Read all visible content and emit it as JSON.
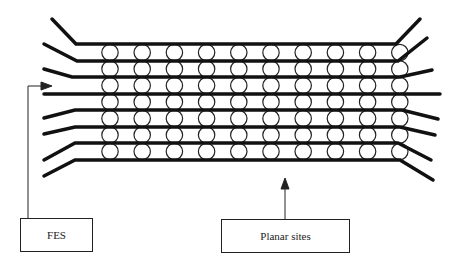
{
  "figure": {
    "layer_count": 8,
    "site_rows": 7,
    "site_columns": 10,
    "line_color": "#111111",
    "site_fill": "#ffffff"
  },
  "labels": {
    "fes": "FES",
    "planar_sites": "Planar sites"
  }
}
